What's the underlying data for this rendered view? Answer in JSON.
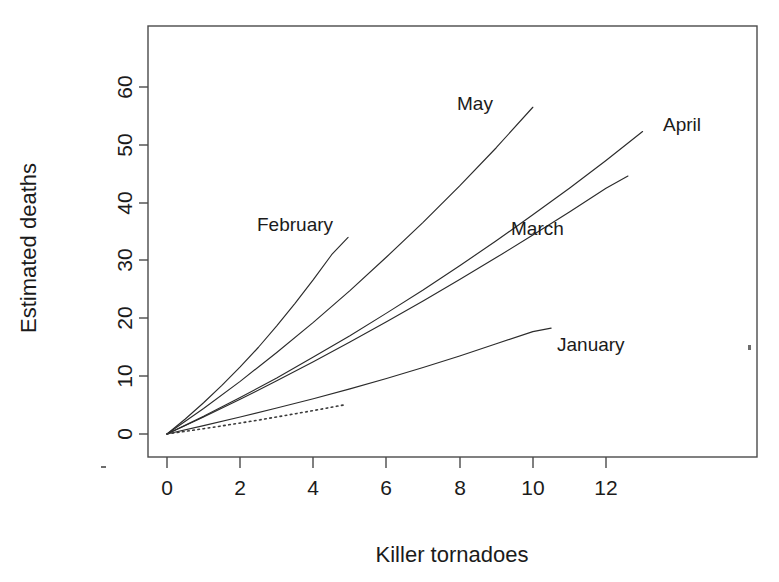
{
  "figure": {
    "title": "",
    "background_color": "#ffffff",
    "line_color": "#2b2b2b",
    "axis_color": "#4a4a4a"
  },
  "axes": {
    "x_title": "Killer tornadoes",
    "y_title": "Estimated deaths",
    "x_ticks": [
      "0",
      "2",
      "4",
      "6",
      "8",
      "10",
      "12"
    ],
    "y_ticks": [
      "0",
      "10",
      "20",
      "30",
      "40",
      "50",
      "60"
    ]
  },
  "series_labels": {
    "january": "January",
    "february": "February",
    "march": "March",
    "april": "April",
    "may": "May"
  },
  "chart_data": {
    "type": "line",
    "title": "",
    "xlabel": "Killer tornadoes",
    "ylabel": "Estimated deaths",
    "xlim": [
      -0.35,
      13.6
    ],
    "ylim": [
      -1.5,
      68
    ],
    "x_ticks": [
      0,
      2,
      4,
      6,
      8,
      10,
      12
    ],
    "y_ticks": [
      0,
      10,
      20,
      30,
      40,
      50,
      60
    ],
    "grid": false,
    "legend": "inline-labels",
    "note": "Five monthly fitted curves of estimated deaths against number of killer tornadoes; all curves pass through the origin and are slightly convex. A dotted reference curve runs lowest, ending near x=4.9.",
    "series": [
      {
        "name": "January",
        "style": "solid",
        "label_position": {
          "x": 10.7,
          "y": 18.5
        },
        "x": [
          0,
          1,
          2,
          3,
          4,
          5,
          6,
          7,
          8,
          9,
          10,
          10.5
        ],
        "y": [
          0,
          1.45,
          2.95,
          4.5,
          6.1,
          7.8,
          9.6,
          11.5,
          13.5,
          15.6,
          17.7,
          18.3
        ]
      },
      {
        "name": "February",
        "style": "solid",
        "label_position": {
          "x": 2.45,
          "y": 33.8
        },
        "x": [
          0,
          0.5,
          1,
          1.5,
          2,
          2.5,
          3,
          3.5,
          4,
          4.5,
          4.95
        ],
        "y": [
          0,
          2.6,
          5.4,
          8.4,
          11.6,
          15.0,
          18.7,
          22.6,
          26.7,
          31.0,
          34.0
        ]
      },
      {
        "name": "March",
        "style": "solid",
        "label_position": {
          "x": 9.8,
          "y": 34.2
        },
        "x": [
          0,
          1,
          2,
          3,
          4,
          5,
          6,
          7,
          8,
          9,
          10,
          11,
          12,
          12.6
        ],
        "y": [
          0,
          2.95,
          6.0,
          9.2,
          12.5,
          15.9,
          19.4,
          23.0,
          26.7,
          30.5,
          34.4,
          38.4,
          42.5,
          44.6
        ]
      },
      {
        "name": "April",
        "style": "solid",
        "label_position": {
          "x": 12.0,
          "y": 51.5
        },
        "x": [
          0,
          1,
          2,
          3,
          4,
          5,
          6,
          7,
          8,
          9,
          10,
          11,
          12,
          13
        ],
        "y": [
          0,
          3.05,
          6.3,
          9.7,
          13.3,
          17.0,
          20.9,
          24.9,
          29.1,
          33.4,
          37.9,
          42.5,
          47.3,
          52.3
        ]
      },
      {
        "name": "May",
        "style": "solid",
        "label_position": {
          "x": 8.2,
          "y": 54.5
        },
        "x": [
          0,
          1,
          2,
          3,
          4,
          5,
          6,
          7,
          8,
          9,
          10
        ],
        "y": [
          0,
          4.4,
          9.1,
          14.1,
          19.3,
          24.8,
          30.6,
          36.6,
          42.9,
          49.5,
          56.5
        ]
      },
      {
        "name": "reference-dotted",
        "style": "dotted",
        "label_position": null,
        "x": [
          0,
          0.5,
          1,
          1.5,
          2,
          2.5,
          3,
          3.5,
          4,
          4.6,
          4.9
        ],
        "y": [
          0,
          0.45,
          0.92,
          1.4,
          1.9,
          2.4,
          2.95,
          3.5,
          4.05,
          4.75,
          5.1
        ]
      }
    ]
  }
}
